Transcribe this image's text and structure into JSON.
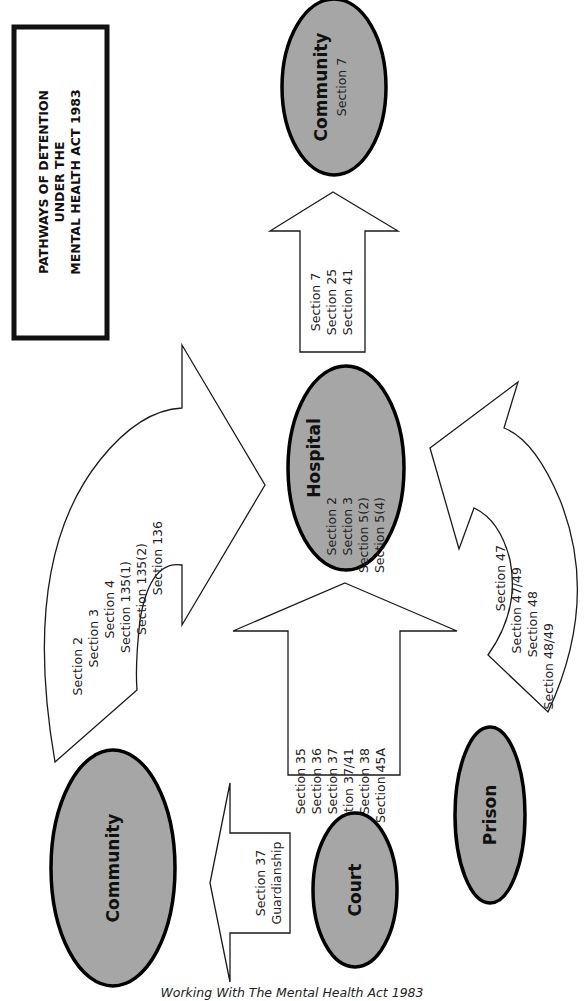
{
  "title": {
    "lines": [
      "PATHWAYS OF DETENTION",
      "UNDER THE",
      "MENTAL HEALTH ACT 1983"
    ]
  },
  "nodes": {
    "community_top": {
      "label": "Community",
      "sections": [
        "Section 7"
      ]
    },
    "hospital": {
      "label": "Hospital",
      "sections": [
        "Section 2",
        "Section 3",
        "Section 5(2)",
        "Section 5(4)"
      ]
    },
    "community_bottom": {
      "label": "Community",
      "sections": []
    },
    "court": {
      "label": "Court",
      "sections": []
    },
    "prison": {
      "label": "Prison",
      "sections": []
    }
  },
  "arrows": {
    "hospital_to_community": {
      "from": "Hospital",
      "to": "Community",
      "sections": [
        "Section 7",
        "Section 25",
        "Section 41"
      ]
    },
    "community_to_hospital": {
      "from": "Community",
      "to": "Hospital",
      "sections": [
        "Section 2",
        "Section 3",
        "Section 4",
        "Section 135(1)",
        "Section 135(2)",
        "Section 136"
      ]
    },
    "court_to_hospital": {
      "from": "Court",
      "to": "Hospital",
      "sections": [
        "Section 35",
        "Section 36",
        "Section 37",
        "Section 37/41",
        "Section 38",
        "Section 45A"
      ]
    },
    "prison_to_hospital": {
      "from": "Prison",
      "to": "Hospital",
      "sections": [
        "Section 47",
        "Section 47/49",
        "Section 48",
        "Section 48/49"
      ]
    },
    "court_to_community": {
      "from": "Court",
      "to": "Community",
      "sections": [
        "Section 37",
        "Guardianship"
      ]
    }
  },
  "colors": {
    "node_fill": "#a6a6a6",
    "node_stroke": "#000000",
    "arrow_fill": "#ffffff",
    "arrow_stroke": "#1a1a1a"
  },
  "caption": "Working With The Mental Health Act 1983"
}
